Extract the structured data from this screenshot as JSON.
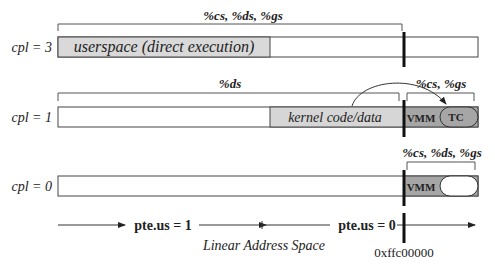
{
  "rows": [
    {
      "cpl_label": "cpl = 3",
      "segments_label": "%cs, %ds, %gs",
      "region_label": "userspace (direct execution)"
    },
    {
      "cpl_label": "cpl = 1",
      "segments_label": "%ds",
      "region_label": "kernel code/data",
      "vmm_label": "VMM",
      "vmm_segments_label": "%cs, %gs",
      "tc_label": "TC"
    },
    {
      "cpl_label": "cpl = 0",
      "vmm_label": "VMM",
      "vmm_segments_label": "%cs, %ds, %gs"
    }
  ],
  "axis": {
    "left_label": "pte.us = 1",
    "right_label": "pte.us = 0",
    "caption": "Linear Address Space",
    "boundary_address": "0xffc00000"
  },
  "colors": {
    "userspace_fill": "#d9d9d9",
    "kernel_fill": "#d6d6d6",
    "vmm_fill": "#a6a6a6",
    "tc_fill": "#a6a6a6",
    "outline": "#444444",
    "divider": "#111111"
  }
}
